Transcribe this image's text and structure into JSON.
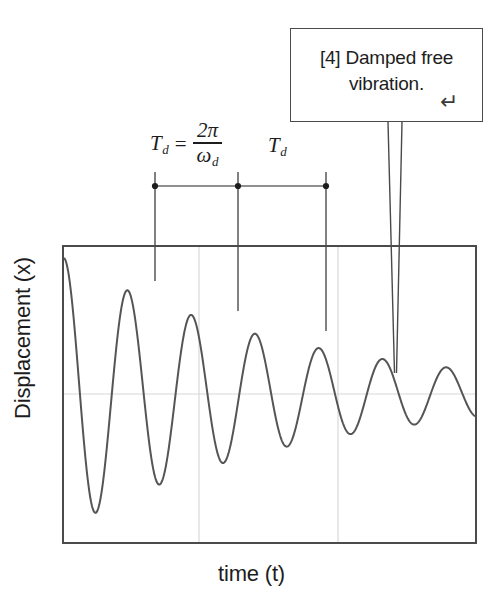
{
  "figure": {
    "y_axis_label": "Displacement (x)",
    "x_axis_label": "time (t)",
    "frame_color": "#4b4b4b",
    "curve_color": "#555555",
    "gridline_color": "#d8d8d8"
  },
  "annotation": {
    "text": "[4] Damped free vibration.",
    "return_glyph": "↵",
    "border_color": "#4a4a4a"
  },
  "labels": {
    "period_symbol": "T",
    "period_subscript": "d",
    "equals": "=",
    "numerator": "2π",
    "denominator_symbol": "ω",
    "denominator_subscript": "d",
    "second_period_symbol": "T",
    "second_period_subscript": "d"
  },
  "chart_data": {
    "type": "line",
    "title": "",
    "xlabel": "time (t)",
    "ylabel": "Displacement (x)",
    "grid": true,
    "legend": false,
    "xlim": [
      0,
      10
    ],
    "ylim": [
      -1.05,
      1.05
    ],
    "model": {
      "amplitude": 1.0,
      "decay_rate": 0.175,
      "angular_frequency_rad_per_unit": 4.05,
      "phase_rad": 0.0
    },
    "gridlines": {
      "horizontal_y_values": [
        0
      ],
      "vertical_x_values": [
        3.3,
        6.65
      ]
    },
    "peaks": [
      {
        "x": 0.0,
        "y": 1.0
      },
      {
        "x": 1.55,
        "y": 0.62
      },
      {
        "x": 3.1,
        "y": 0.46
      },
      {
        "x": 4.65,
        "y": 0.34
      },
      {
        "x": 6.2,
        "y": 0.25
      },
      {
        "x": 7.75,
        "y": 0.2
      },
      {
        "x": 9.3,
        "y": 0.15
      }
    ],
    "troughs": [
      {
        "x": 0.78,
        "y": -0.79
      },
      {
        "x": 2.33,
        "y": -0.55
      },
      {
        "x": 3.88,
        "y": -0.4
      },
      {
        "x": 5.43,
        "y": -0.3
      },
      {
        "x": 6.98,
        "y": -0.22
      },
      {
        "x": 8.53,
        "y": -0.17
      }
    ],
    "annotations": [
      {
        "label": "T_d = 2pi / omega_d",
        "type": "period-span",
        "from_x": 1.55,
        "to_x": 3.1
      },
      {
        "label": "T_d",
        "type": "period-span",
        "from_x": 3.1,
        "to_x": 4.65
      },
      {
        "label": "[4] Damped free vibration.",
        "type": "callout",
        "points_to_x": 7.75
      }
    ]
  }
}
